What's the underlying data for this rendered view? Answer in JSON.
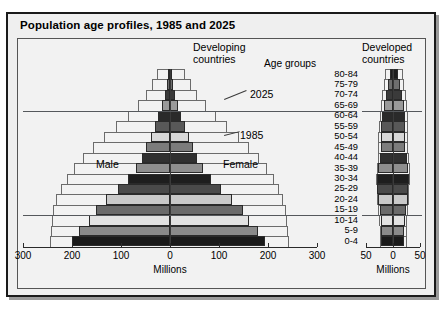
{
  "title": "Population age profiles, 1985 and 2025",
  "panels": {
    "developing": {
      "heading_line1": "Developing",
      "heading_line2": "countries"
    },
    "developed": {
      "heading_line1": "Developed",
      "heading_line2": "countries"
    }
  },
  "age_groups_title": "Age groups",
  "annotations": {
    "year_2025": "2025",
    "year_1985": "1985",
    "male": "Male",
    "female": "Female"
  },
  "axes": {
    "left": {
      "title": "Millions",
      "ticks": [
        "300",
        "200",
        "100",
        "0",
        "100",
        "200",
        "300"
      ],
      "max": 300
    },
    "right": {
      "title": "Millions",
      "ticks": [
        "50",
        "0",
        "50"
      ],
      "max": 50
    }
  },
  "chart_data": {
    "type": "bar",
    "title": "Population age profiles, 1985 and 2025",
    "subtype": "population-pyramid",
    "xlabel": "Millions",
    "ylabel": "Age groups",
    "grid": false,
    "legend_position": "inline-annotations",
    "categories": [
      "80-84",
      "75-79",
      "70-74",
      "65-69",
      "60-64",
      "55-59",
      "50-54",
      "45-49",
      "40-44",
      "35-39",
      "30-34",
      "25-29",
      "20-24",
      "15-19",
      "10-14",
      "5-9",
      "0-4"
    ],
    "panels": [
      {
        "name": "Developing countries",
        "xlim": [
          -300,
          300
        ],
        "xticks": [
          -300,
          -200,
          -100,
          0,
          100,
          200,
          300
        ],
        "series": [
          {
            "name": "1985",
            "style": "filled-bars",
            "male": [
              4,
              7,
              11,
              17,
              24,
              31,
              39,
              48,
              58,
              70,
              86,
              107,
              131,
              152,
              166,
              185,
              200
            ],
            "female": [
              4,
              7,
              11,
              16,
              23,
              30,
              38,
              47,
              56,
              68,
              84,
              104,
              127,
              148,
              161,
              179,
              193
            ]
          },
          {
            "name": "2025",
            "style": "step-outline",
            "male": [
              26,
              37,
              50,
              66,
              86,
              110,
              135,
              158,
              178,
              196,
              211,
              223,
              232,
              238,
              241,
              243,
              244
            ],
            "female": [
              30,
              42,
              56,
              73,
              93,
              116,
              140,
              162,
              181,
              198,
              212,
              223,
              231,
              236,
              239,
              241,
              242
            ]
          }
        ]
      },
      {
        "name": "Developed countries",
        "xlim": [
          -50,
          50
        ],
        "xticks": [
          -50,
          0,
          50
        ],
        "series": [
          {
            "name": "1985",
            "style": "filled-bars",
            "male": [
              6,
              9,
              13,
              17,
              20,
              22,
              22,
              22,
              24,
              28,
              30,
              29,
              27,
              25,
              23,
              22,
              22
            ],
            "female": [
              10,
              13,
              17,
              20,
              22,
              23,
              23,
              23,
              25,
              28,
              30,
              28,
              27,
              24,
              22,
              21,
              21
            ]
          },
          {
            "name": "2025",
            "style": "step-outline",
            "male": [
              14,
              17,
              20,
              23,
              25,
              26,
              27,
              27,
              28,
              30,
              31,
              30,
              29,
              27,
              26,
              25,
              25
            ],
            "female": [
              18,
              21,
              24,
              26,
              27,
              28,
              28,
              28,
              29,
              31,
              31,
              30,
              29,
              27,
              26,
              25,
              25
            ]
          }
        ]
      }
    ],
    "reference_lines": [
      {
        "between": [
          "65-69",
          "60-64"
        ],
        "label": ""
      },
      {
        "between": [
          "15-19",
          "10-14"
        ],
        "label": ""
      }
    ],
    "bar_fills": [
      "#1c1c1c",
      "#6e6e6e",
      "#3a3a3a",
      "#9a9a9a",
      "#2a2a2a",
      "#585858",
      "#d7d7d7",
      "#7c7c7c",
      "#303030",
      "#8e8e8e",
      "#1e1e1e",
      "#4a4a4a",
      "#c9c9c9",
      "#6a6a6a",
      "#e2e2e2",
      "#8a8a8a",
      "#1a1a1a"
    ]
  }
}
